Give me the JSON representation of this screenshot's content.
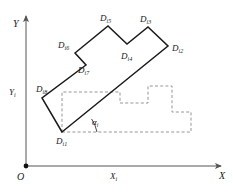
{
  "figure": {
    "type": "geometry-diagram",
    "colors": {
      "axis": "#555555",
      "polygon_stroke": "#1a1a1a",
      "dashed_stroke": "#8a8a8a",
      "label_text": "#1a1a1a",
      "background": "#ffffff"
    }
  },
  "axes": {
    "origin_label": "O",
    "x_axis_label": "X",
    "y_axis_label": "Y",
    "x_local_label": {
      "base": "X",
      "sub": "i"
    },
    "y_local_label": {
      "base": "Y",
      "sub": "i"
    },
    "angle_label": {
      "base": "α",
      "sub": "i"
    }
  },
  "vertices": [
    {
      "id": "Di1",
      "base": "D",
      "sub": "i1",
      "x": 62,
      "y": 132,
      "label_x": 56,
      "label_y": 137
    },
    {
      "id": "Di2",
      "base": "D",
      "sub": "i2",
      "x": 168,
      "y": 46,
      "label_x": 172,
      "label_y": 44
    },
    {
      "id": "Di3",
      "base": "D",
      "sub": "i3",
      "x": 148,
      "y": 27,
      "label_x": 140,
      "label_y": 15
    },
    {
      "id": "Di4",
      "base": "D",
      "sub": "i4",
      "x": 127,
      "y": 44,
      "label_x": 121,
      "label_y": 52
    },
    {
      "id": "Di5",
      "base": "D",
      "sub": "i5",
      "x": 108,
      "y": 26,
      "label_x": 100,
      "label_y": 14
    },
    {
      "id": "Di6",
      "base": "D",
      "sub": "i6",
      "x": 75,
      "y": 53,
      "label_x": 58,
      "label_y": 41
    },
    {
      "id": "Di7",
      "base": "D",
      "sub": "i7",
      "x": 86,
      "y": 65,
      "label_x": 78,
      "label_y": 66
    },
    {
      "id": "Di8",
      "base": "D",
      "sub": "i8",
      "x": 42,
      "y": 98,
      "label_x": 36,
      "label_y": 85
    }
  ],
  "polygon_path": "M 62 132 L 168 46 L 148 27 L 127 44 L 108 26 L 75 53 L 86 65 L 42 98 Z",
  "dashed_path": "M 62 132 L 191 132 L 191 112 L 172 112 L 172 86 L 148 86 L 148 103 L 120 103 L 120 92 L 62 92 Z",
  "axis_lines": {
    "x_start_x": 26,
    "x_start_y": 166,
    "x_end_x": 221,
    "x_end_y": 166,
    "y_start_x": 26,
    "y_start_y": 166,
    "y_end_x": 26,
    "y_end_y": 16
  }
}
